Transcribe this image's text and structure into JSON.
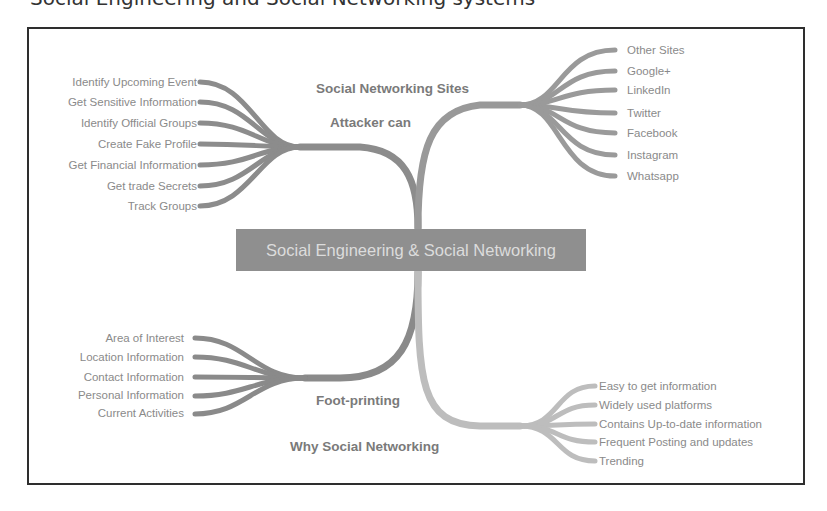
{
  "caption": "Social Engineering and Social Networking systems",
  "center": {
    "label": "Social Engineering & Social Networking"
  },
  "branches": {
    "attacker": {
      "label": "Attacker can",
      "items": [
        "Identify Upcoming Event",
        "Get Sensitive Information",
        "Identify Official Groups",
        "Create Fake Profile",
        "Get Financial Information",
        "Get trade Secrets",
        "Track Groups"
      ]
    },
    "sites": {
      "label": "Social Networking Sites",
      "items": [
        "Other Sites",
        "Google+",
        "LinkedIn",
        "Twitter",
        "Facebook",
        "Instagram",
        "Whatsapp"
      ]
    },
    "footprinting": {
      "label": "Foot-printing",
      "items": [
        "Area of Interest",
        "Location Information",
        "Contact Information",
        "Personal Information",
        "Current Activities"
      ]
    },
    "why": {
      "label": "Why Social Networking",
      "items": [
        "Easy to get information",
        "Widely used platforms",
        "Contains Up-to-date information",
        "Frequent Posting and updates",
        "Trending"
      ]
    }
  },
  "colors": {
    "branch_dark": "#8c8c8c",
    "branch_light": "#b9b9b9",
    "center_bg": "#8f8f8f",
    "frame": "#2e2e2e"
  }
}
